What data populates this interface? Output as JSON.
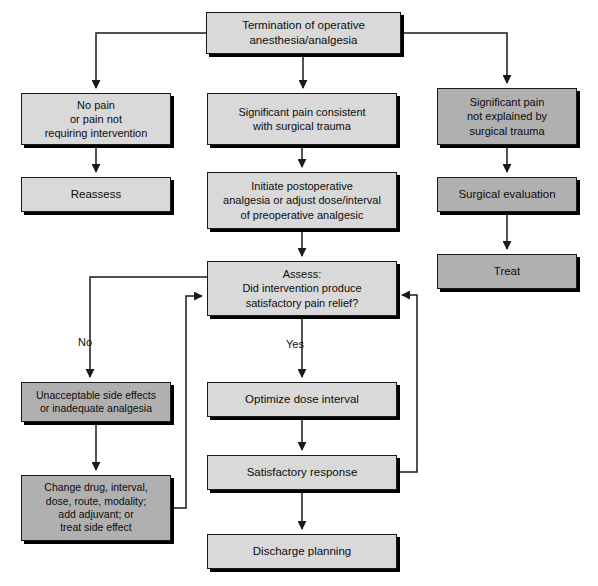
{
  "diagram": {
    "colors": {
      "box_light": "#d9d9d9",
      "box_dark": "#b0b0b0",
      "border": "#1a1a1a",
      "shadow": "#000000",
      "line": "#1a1a1a",
      "background": "#ffffff",
      "text": "#0d0d0d"
    },
    "nodes": [
      {
        "id": "termination",
        "label": "Termination of operative\nanesthesia/analgesia",
        "tone": "light",
        "x": 206,
        "y": 12,
        "w": 195,
        "h": 42,
        "font": 11.5
      },
      {
        "id": "no-pain",
        "label": "No pain\nor pain not\nrequiring intervention",
        "tone": "light",
        "x": 21,
        "y": 93,
        "w": 150,
        "h": 52,
        "font": 11
      },
      {
        "id": "significant-pain-consistent",
        "label": "Significant pain consistent\nwith surgical trauma",
        "tone": "light",
        "x": 207,
        "y": 93,
        "w": 190,
        "h": 52,
        "font": 11
      },
      {
        "id": "significant-pain-unexplained",
        "label": "Significant pain\nnot explained by\nsurgical trauma",
        "tone": "dark",
        "x": 437,
        "y": 88,
        "w": 140,
        "h": 57,
        "font": 11
      },
      {
        "id": "reassess",
        "label": "Reassess",
        "tone": "light",
        "x": 21,
        "y": 177,
        "w": 150,
        "h": 35,
        "font": 11.5
      },
      {
        "id": "initiate-postoperative",
        "label": "Initiate postoperative\nanalgesia or adjust dose/interval\nof preoperative analgesic",
        "tone": "light",
        "x": 207,
        "y": 172,
        "w": 190,
        "h": 57,
        "font": 11
      },
      {
        "id": "surgical-evaluation",
        "label": "Surgical evaluation",
        "tone": "dark",
        "x": 437,
        "y": 177,
        "w": 140,
        "h": 35,
        "font": 11.5
      },
      {
        "id": "treat",
        "label": "Treat",
        "tone": "dark",
        "x": 437,
        "y": 254,
        "w": 140,
        "h": 35,
        "font": 11.5
      },
      {
        "id": "assess",
        "label": "Assess:\nDid intervention produce\nsatisfactory pain relief?",
        "tone": "light",
        "x": 207,
        "y": 261,
        "w": 190,
        "h": 55,
        "font": 11
      },
      {
        "id": "unacceptable-side-effects",
        "label": "Unacceptable side effects\nor inadequate analgesia",
        "tone": "dark",
        "x": 21,
        "y": 382,
        "w": 150,
        "h": 40,
        "font": 10.5
      },
      {
        "id": "change-drug",
        "label": "Change drug, interval,\ndose, route, modality;\nadd adjuvant; or\ntreat side effect",
        "tone": "dark",
        "x": 21,
        "y": 475,
        "w": 150,
        "h": 66,
        "font": 10.5
      },
      {
        "id": "optimize-dose-interval",
        "label": "Optimize dose interval",
        "tone": "light",
        "x": 207,
        "y": 382,
        "w": 190,
        "h": 35,
        "font": 11.5
      },
      {
        "id": "satisfactory-response",
        "label": "Satisfactory response",
        "tone": "light",
        "x": 207,
        "y": 455,
        "w": 190,
        "h": 35,
        "font": 11.5
      },
      {
        "id": "discharge-planning",
        "label": "Discharge planning",
        "tone": "light",
        "x": 207,
        "y": 534,
        "w": 190,
        "h": 35,
        "font": 11.5
      }
    ],
    "edge_labels": [
      {
        "id": "no-label",
        "text": "No",
        "x": 78,
        "y": 336
      },
      {
        "id": "yes-label",
        "text": "Yes",
        "x": 286,
        "y": 338
      }
    ]
  }
}
